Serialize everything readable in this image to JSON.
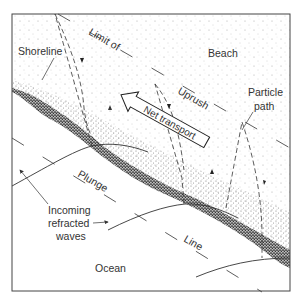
{
  "diagram": {
    "type": "longshore-drift-diagram",
    "colors": {
      "line": "#333333",
      "sand_dark": "#222222",
      "sand_light": "#8a8a8a",
      "background": "#ffffff"
    },
    "labels": {
      "beach": "Beach",
      "shoreline": "Shoreline",
      "limit_of": "Limit of",
      "uprush": "Uprush",
      "particle_path_1": "Particle",
      "particle_path_2": "path",
      "net_transport": "Net transport",
      "plunge": "Plunge",
      "line": "Line",
      "incoming_1": "Incoming",
      "incoming_2": "refracted",
      "incoming_3": "waves",
      "ocean": "Ocean"
    }
  }
}
